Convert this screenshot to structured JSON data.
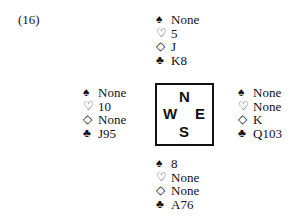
{
  "problem_label": "(16)",
  "suit_icons": {
    "spade": "♠",
    "heart": "♡",
    "diamond": "◇",
    "club": "♣"
  },
  "compass": {
    "n": "N",
    "w": "W",
    "e": "E",
    "s": "S"
  },
  "hands": {
    "north": {
      "spades": "None",
      "hearts": "5",
      "diamonds": "J",
      "clubs": "K8"
    },
    "west": {
      "spades": "None",
      "hearts": "10",
      "diamonds": "None",
      "clubs": "J95"
    },
    "east": {
      "spades": "None",
      "hearts": "None",
      "diamonds": "K",
      "clubs": "Q103"
    },
    "south": {
      "spades": "8",
      "hearts": "None",
      "diamonds": "None",
      "clubs": "A76"
    }
  }
}
